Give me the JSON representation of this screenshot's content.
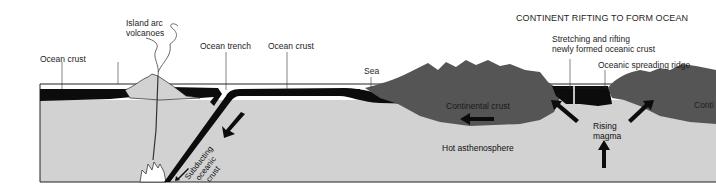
{
  "title": "CONTINENT RIFTING TO FORM OCEAN",
  "labels": {
    "island_arc_line1": "Island arc",
    "island_arc_line2": "volcanoes",
    "ocean_crust_left": "Ocean crust",
    "ocean_trench": "Ocean trench",
    "ocean_crust_mid": "Ocean crust",
    "sea": "Sea",
    "stretching_line1": "Stretching and rifting",
    "stretching_line2": "newly formed oceanic crust",
    "spreading_ridge": "Oceanic spreading ridge"
  },
  "inner_labels": {
    "continental_crust": "Continental crust",
    "continental_right": "Conti",
    "hot_asthenosphere": "Hot asthenosphere",
    "rising_line1": "Rising",
    "rising_line2": "magma",
    "subducting_line1": "Subducting",
    "subducting_line2": "oceanic",
    "subducting_line3": "crust"
  },
  "colors": {
    "mantle": "#d2d2d2",
    "ocean_crust": "#0c0c0c",
    "continental_crust": "#555555",
    "outline": "#222222",
    "background": "#ffffff"
  }
}
